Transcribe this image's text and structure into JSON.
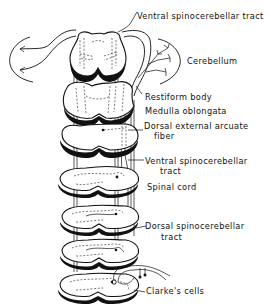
{
  "figure": {
    "labels": {
      "ventral_tract_top": "Ventral spinocerebellar tract",
      "cerebellum": "Cerebellum",
      "restiform_body": "Restiform body",
      "medulla": "Medulla oblongata",
      "dorsal_arcuate_line1": "Dorsal external arcuate",
      "dorsal_arcuate_line2": "fiber",
      "ventral_tract_mid_line1": "Ventral spinocerebellar",
      "ventral_tract_mid_line2": "tract",
      "spinal_cord": "Spinal cord",
      "dorsal_tract_line1": "Dorsal spinocerebellar",
      "dorsal_tract_line2": "tract",
      "clarkes_cells": "Clarke's cells"
    },
    "sections": [
      {
        "name": "cerebellum-level-section"
      },
      {
        "name": "medulla-upper-section"
      },
      {
        "name": "medulla-lower-section"
      },
      {
        "name": "spinal-cord-section-1"
      },
      {
        "name": "spinal-cord-section-2"
      },
      {
        "name": "spinal-cord-section-3"
      },
      {
        "name": "spinal-cord-section-4"
      }
    ]
  }
}
